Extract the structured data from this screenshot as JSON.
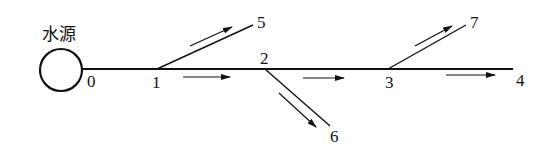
{
  "diagram": {
    "source_label": "水源",
    "nodes": [
      {
        "id": "0",
        "label": "0"
      },
      {
        "id": "1",
        "label": "1"
      },
      {
        "id": "2",
        "label": "2"
      },
      {
        "id": "3",
        "label": "3"
      },
      {
        "id": "4",
        "label": "4"
      },
      {
        "id": "5",
        "label": "5"
      },
      {
        "id": "6",
        "label": "6"
      },
      {
        "id": "7",
        "label": "7"
      }
    ],
    "edges": [
      {
        "from": "0",
        "to": "1"
      },
      {
        "from": "1",
        "to": "2"
      },
      {
        "from": "2",
        "to": "3"
      },
      {
        "from": "3",
        "to": "4"
      },
      {
        "from": "1",
        "to": "5"
      },
      {
        "from": "2",
        "to": "6"
      },
      {
        "from": "3",
        "to": "7"
      }
    ],
    "colors": {
      "line": "#111111",
      "background": "#ffffff"
    }
  }
}
